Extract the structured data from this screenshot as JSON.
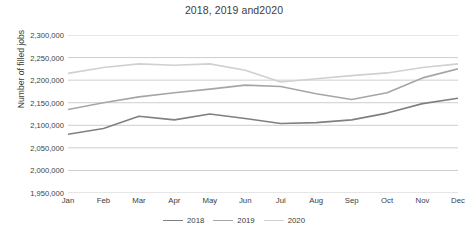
{
  "chart_data": {
    "type": "line",
    "title": "2018, 2019 and2020",
    "xlabel": "",
    "ylabel": "Number of filled jobs",
    "categories": [
      "Jan",
      "Feb",
      "Mar",
      "Apr",
      "May",
      "Jun",
      "Jul",
      "Aug",
      "Sep",
      "Oct",
      "Nov",
      "Dec"
    ],
    "ylim": [
      1950000,
      2300000
    ],
    "ytick_step": 50000,
    "ytick_labels": [
      "2,300,000",
      "2,250,000",
      "2,200,000",
      "2,150,000",
      "2,100,000",
      "2,050,000",
      "2,000,000",
      "1,950,000"
    ],
    "ytick_values": [
      2300000,
      2250000,
      2200000,
      2150000,
      2100000,
      2050000,
      2000000,
      1950000
    ],
    "grid": true,
    "grid_axis": "y",
    "legend_position": "bottom",
    "series": [
      {
        "name": "2018",
        "color": "#808080",
        "values": [
          2080000,
          2093000,
          2120000,
          2112000,
          2125000,
          2115000,
          2104000,
          2106000,
          2112000,
          2127000,
          2148000,
          2160000
        ]
      },
      {
        "name": "2019",
        "color": "#a6a6a6",
        "values": [
          2135000,
          2150000,
          2163000,
          2172000,
          2180000,
          2189000,
          2186000,
          2170000,
          2157000,
          2172000,
          2205000,
          2225000
        ]
      },
      {
        "name": "2020",
        "color": "#d0d0d0",
        "values": [
          2215000,
          2228000,
          2236000,
          2233000,
          2236000,
          2222000,
          2196000,
          2203000,
          2210000,
          2216000,
          2228000,
          2236000
        ]
      }
    ]
  },
  "legend": {
    "items": [
      {
        "label": "2018",
        "color": "#808080"
      },
      {
        "label": "2019",
        "color": "#a6a6a6"
      },
      {
        "label": "2020",
        "color": "#d0d0d0"
      }
    ]
  },
  "style": {
    "grid_color": "#b8b8b8",
    "text_color": "#3d3d3d",
    "background": "#ffffff"
  }
}
